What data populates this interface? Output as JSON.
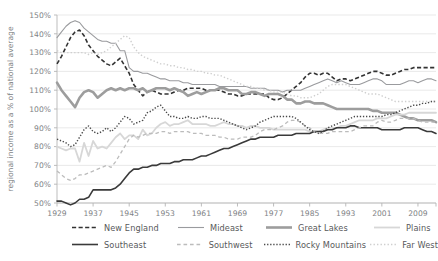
{
  "chart_data": {
    "type": "line",
    "title": "",
    "xlabel": "",
    "ylabel": "regional income as a % of national average",
    "xlim": [
      1929,
      2013
    ],
    "ylim": [
      50,
      150
    ],
    "ytick_labels": [
      "150%",
      "140%",
      "130%",
      "120%",
      "110%",
      "100%",
      "90%",
      "80%",
      "70%",
      "60%",
      "50%"
    ],
    "ytick_values": [
      150,
      140,
      130,
      120,
      110,
      100,
      90,
      80,
      70,
      60,
      50
    ],
    "xtick_labels": [
      "1929",
      "1937",
      "1945",
      "1953",
      "1961",
      "1969",
      "1977",
      "1985",
      "1993",
      "2001",
      "2009"
    ],
    "xtick_values": [
      1929,
      1937,
      1945,
      1953,
      1961,
      1969,
      1977,
      1985,
      1993,
      2001,
      2009
    ],
    "grid": "horizontal",
    "legend_position": "bottom",
    "x": [
      1929,
      1930,
      1931,
      1932,
      1933,
      1934,
      1935,
      1936,
      1937,
      1938,
      1939,
      1940,
      1941,
      1942,
      1943,
      1944,
      1945,
      1946,
      1947,
      1948,
      1949,
      1950,
      1951,
      1952,
      1953,
      1954,
      1955,
      1956,
      1957,
      1958,
      1959,
      1960,
      1961,
      1962,
      1963,
      1964,
      1965,
      1966,
      1967,
      1968,
      1969,
      1970,
      1971,
      1972,
      1973,
      1974,
      1975,
      1976,
      1977,
      1978,
      1979,
      1980,
      1981,
      1982,
      1983,
      1984,
      1985,
      1986,
      1987,
      1988,
      1989,
      1990,
      1991,
      1992,
      1993,
      1994,
      1995,
      1996,
      1997,
      1998,
      1999,
      2000,
      2001,
      2002,
      2003,
      2004,
      2005,
      2006,
      2007,
      2008,
      2009,
      2010,
      2011,
      2012,
      2013
    ],
    "series": [
      {
        "name": "New England",
        "style": "dashed",
        "color": "#333333",
        "width": 1.6,
        "values": [
          124,
          128,
          133,
          138,
          141,
          142,
          139,
          134,
          131,
          128,
          126,
          124,
          123,
          125,
          127,
          123,
          119,
          113,
          110,
          107,
          109,
          110,
          109,
          108,
          108,
          108,
          109,
          110,
          110,
          111,
          111,
          111,
          111,
          110,
          110,
          110,
          110,
          109,
          108,
          108,
          107,
          107,
          108,
          108,
          108,
          108,
          108,
          106,
          105,
          105,
          106,
          108,
          110,
          112,
          114,
          117,
          119,
          119,
          118,
          119,
          119,
          117,
          115,
          116,
          116,
          115,
          116,
          117,
          118,
          119,
          120,
          120,
          119,
          118,
          118,
          119,
          120,
          121,
          121,
          122,
          122,
          122,
          122,
          122,
          122
        ]
      },
      {
        "name": "Mideast",
        "style": "solid",
        "color": "#9a9b9e",
        "width": 1.1,
        "values": [
          138,
          141,
          144,
          146,
          147,
          146,
          143,
          141,
          139,
          137,
          136,
          136,
          135,
          135,
          131,
          131,
          122,
          120,
          120,
          119,
          119,
          118,
          117,
          116,
          116,
          115,
          115,
          115,
          114,
          114,
          113,
          113,
          113,
          113,
          113,
          113,
          112,
          112,
          112,
          112,
          112,
          112,
          112,
          111,
          111,
          111,
          111,
          110,
          110,
          110,
          109,
          110,
          110,
          110,
          110,
          111,
          112,
          113,
          114,
          115,
          116,
          115,
          114,
          115,
          114,
          113,
          113,
          113,
          114,
          115,
          116,
          116,
          115,
          113,
          113,
          113,
          113,
          114,
          115,
          115,
          114,
          115,
          116,
          116,
          115
        ]
      },
      {
        "name": "Great Lakes",
        "style": "solid",
        "color": "#9d9d9d",
        "width": 2.6,
        "values": [
          114,
          110,
          107,
          104,
          101,
          106,
          109,
          110,
          109,
          106,
          108,
          110,
          111,
          110,
          111,
          110,
          111,
          111,
          110,
          111,
          109,
          110,
          111,
          111,
          111,
          110,
          111,
          110,
          109,
          107,
          108,
          109,
          108,
          109,
          110,
          110,
          111,
          111,
          110,
          110,
          110,
          108,
          108,
          109,
          109,
          108,
          107,
          108,
          108,
          108,
          107,
          105,
          105,
          103,
          103,
          104,
          104,
          103,
          103,
          103,
          102,
          101,
          100,
          100,
          100,
          100,
          100,
          100,
          100,
          100,
          99,
          99,
          98,
          98,
          98,
          98,
          97,
          96,
          95,
          95,
          94,
          94,
          94,
          94,
          93
        ]
      },
      {
        "name": "Plains",
        "style": "solid",
        "color": "#d7d7d7",
        "width": 1.8,
        "values": [
          80,
          79,
          78,
          79,
          79,
          72,
          82,
          75,
          83,
          79,
          80,
          79,
          82,
          85,
          87,
          84,
          86,
          86,
          84,
          89,
          86,
          87,
          90,
          92,
          93,
          91,
          92,
          92,
          93,
          94,
          92,
          92,
          92,
          92,
          91,
          91,
          92,
          93,
          92,
          92,
          91,
          91,
          90,
          91,
          91,
          90,
          90,
          90,
          89,
          89,
          89,
          89,
          89,
          89,
          89,
          89,
          88,
          88,
          88,
          89,
          90,
          90,
          90,
          91,
          91,
          92,
          93,
          94,
          94,
          94,
          94,
          95,
          95,
          95,
          96,
          97,
          97,
          97,
          98,
          98,
          98,
          98,
          98,
          98,
          98
        ]
      },
      {
        "name": "Southeast",
        "style": "solid",
        "color": "#3a3a3a",
        "width": 1.6,
        "values": [
          51,
          51,
          50,
          49,
          50,
          52,
          52,
          53,
          57,
          57,
          57,
          57,
          57,
          58,
          60,
          63,
          66,
          68,
          68,
          69,
          69,
          70,
          70,
          71,
          71,
          71,
          72,
          72,
          73,
          73,
          73,
          74,
          75,
          75,
          76,
          77,
          78,
          79,
          79,
          80,
          81,
          82,
          83,
          84,
          84,
          85,
          85,
          85,
          85,
          86,
          86,
          86,
          86,
          87,
          87,
          87,
          87,
          88,
          88,
          88,
          89,
          89,
          90,
          90,
          90,
          91,
          91,
          90,
          90,
          90,
          90,
          90,
          89,
          89,
          89,
          89,
          89,
          90,
          90,
          90,
          90,
          89,
          88,
          88,
          87
        ]
      },
      {
        "name": "Southwest",
        "style": "dashed-light",
        "color": "#bcbcbc",
        "width": 1.3,
        "values": [
          67,
          65,
          63,
          62,
          63,
          65,
          65,
          66,
          67,
          68,
          69,
          70,
          69,
          72,
          76,
          80,
          84,
          86,
          85,
          86,
          87,
          87,
          87,
          88,
          88,
          87,
          88,
          88,
          88,
          88,
          87,
          87,
          87,
          86,
          86,
          86,
          85,
          85,
          84,
          84,
          84,
          85,
          85,
          85,
          86,
          88,
          89,
          89,
          89,
          90,
          91,
          93,
          94,
          94,
          93,
          91,
          90,
          88,
          87,
          87,
          87,
          88,
          88,
          88,
          88,
          88,
          89,
          90,
          91,
          91,
          91,
          93,
          94,
          93,
          93,
          94,
          95,
          95,
          95,
          95,
          94,
          93,
          93,
          93,
          93
        ]
      },
      {
        "name": "Rocky Mountains",
        "style": "dotted",
        "color": "#4a4a4a",
        "width": 1.4,
        "values": [
          84,
          83,
          82,
          80,
          81,
          85,
          89,
          91,
          88,
          87,
          88,
          90,
          88,
          90,
          93,
          96,
          95,
          92,
          93,
          94,
          98,
          99,
          101,
          102,
          99,
          96,
          96,
          95,
          95,
          96,
          95,
          95,
          96,
          96,
          95,
          95,
          95,
          94,
          93,
          92,
          91,
          90,
          89,
          90,
          91,
          93,
          94,
          95,
          96,
          96,
          96,
          96,
          96,
          95,
          93,
          91,
          89,
          88,
          87,
          88,
          90,
          91,
          92,
          93,
          94,
          95,
          96,
          96,
          96,
          96,
          96,
          96,
          96,
          97,
          97,
          98,
          99,
          100,
          101,
          102,
          102,
          103,
          103,
          104,
          104
        ]
      },
      {
        "name": "Far West",
        "style": "dotted-light",
        "color": "#cfcfcf",
        "width": 1.4,
        "values": [
          131,
          130,
          130,
          130,
          130,
          130,
          130,
          129,
          130,
          129,
          130,
          131,
          133,
          135,
          137,
          139,
          138,
          133,
          130,
          128,
          127,
          126,
          125,
          124,
          124,
          123,
          123,
          122,
          122,
          121,
          121,
          120,
          120,
          119,
          119,
          118,
          118,
          117,
          116,
          115,
          114,
          113,
          112,
          112,
          111,
          111,
          110,
          110,
          109,
          109,
          109,
          108,
          107,
          107,
          106,
          106,
          106,
          107,
          108,
          110,
          112,
          113,
          113,
          113,
          113,
          112,
          111,
          110,
          109,
          108,
          108,
          108,
          107,
          106,
          105,
          104,
          104,
          104,
          104,
          104,
          104,
          104,
          104,
          104,
          104
        ]
      }
    ]
  },
  "legend": {
    "rows": [
      [
        {
          "label": "New England",
          "style": "dashed",
          "color": "#333333",
          "width": 1.6
        },
        {
          "label": "Mideast",
          "style": "solid",
          "color": "#9a9b9e",
          "width": 1.1
        },
        {
          "label": "Great Lakes",
          "style": "solid",
          "color": "#9d9d9d",
          "width": 2.6
        },
        {
          "label": "Plains",
          "style": "solid",
          "color": "#d7d7d7",
          "width": 1.8
        }
      ],
      [
        {
          "label": "Southeast",
          "style": "solid",
          "color": "#3a3a3a",
          "width": 1.6
        },
        {
          "label": "Southwest",
          "style": "dashed-light",
          "color": "#bcbcbc",
          "width": 1.3
        },
        {
          "label": "Rocky Mountains",
          "style": "dotted",
          "color": "#4a4a4a",
          "width": 1.4
        },
        {
          "label": "Far West",
          "style": "dotted-light",
          "color": "#cfcfcf",
          "width": 1.4
        }
      ]
    ]
  },
  "colors": {
    "grid": "#e3e3e3",
    "axis": "#b5b5b5",
    "text": "#808285",
    "background": "#ffffff"
  }
}
